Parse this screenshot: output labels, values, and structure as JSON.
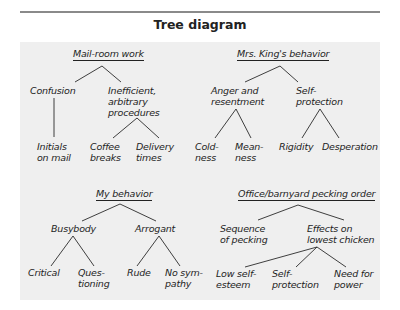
{
  "title": "Tree diagram",
  "trees": [
    {
      "root": "Mail-room work",
      "children": [
        {
          "label": "Confusion",
          "children": [
            {
              "label": "Initials\non mail"
            }
          ]
        },
        {
          "label": "Inefficient,\narbitrary\nprocedures",
          "children": [
            {
              "label": "Coffee\nbreaks"
            },
            {
              "label": "Delivery\ntimes"
            }
          ]
        }
      ]
    },
    {
      "root": "Mrs. King's behavior",
      "children": [
        {
          "label": "Anger and\nresentment",
          "children": [
            {
              "label": "Cold-\nness"
            },
            {
              "label": "Mean-\nness"
            }
          ]
        },
        {
          "label": "Self-\nprotection",
          "children": [
            {
              "label": "Rigidity"
            },
            {
              "label": "Desperation"
            }
          ]
        }
      ]
    },
    {
      "root": "My behavior",
      "children": [
        {
          "label": "Busybody",
          "children": [
            {
              "label": "Critical"
            },
            {
              "label": "Ques-\ntioning"
            }
          ]
        },
        {
          "label": "Arrogant",
          "children": [
            {
              "label": "Rude"
            },
            {
              "label": "No sym-\npathy"
            }
          ]
        }
      ]
    },
    {
      "root": "Office/barnyard pecking order",
      "children": [
        {
          "label": "Sequence\nof pecking",
          "children": []
        },
        {
          "label": "Effects on\nlowest chicken",
          "children": [
            {
              "label": "Low self-\nesteem"
            },
            {
              "label": "Self-\nprotection"
            },
            {
              "label": "Need for\npower"
            }
          ]
        }
      ]
    }
  ],
  "colors": {
    "panel": "#efefef",
    "rule": "#8a8a8a",
    "ink": "#1e1e1e"
  }
}
